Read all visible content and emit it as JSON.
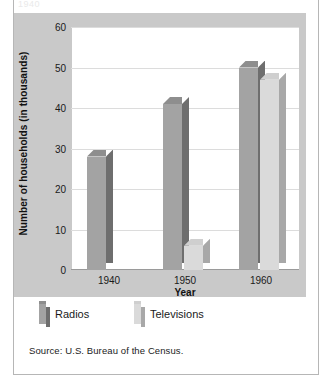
{
  "figure": {
    "cut_off_title": "1940",
    "source": "Source: U.S. Bureau of the Census."
  },
  "legend": {
    "items": [
      {
        "label": "Radios",
        "color": "#a3a3a3"
      },
      {
        "label": "Televisions",
        "color": "#dadada"
      }
    ]
  },
  "chart_data": {
    "type": "bar",
    "title": "",
    "xlabel": "Year",
    "ylabel": "Number of households (in thousands)",
    "categories": [
      "1940",
      "1950",
      "1960"
    ],
    "series": [
      {
        "name": "Radios",
        "values": [
          28,
          41,
          50
        ],
        "color": "#a3a3a3"
      },
      {
        "name": "Televisions",
        "values": [
          0,
          6,
          47
        ],
        "color": "#dadada"
      }
    ],
    "ylim": [
      0,
      60
    ],
    "yticks": [
      0,
      10,
      20,
      30,
      40,
      50,
      60
    ],
    "ytick_labels": [
      "0",
      "10",
      "20",
      "30",
      "40",
      "50",
      "60"
    ],
    "grid": true,
    "legend_position": "below-plot",
    "style": "3d-bars",
    "source": "Source: U.S. Bureau of the Census."
  }
}
